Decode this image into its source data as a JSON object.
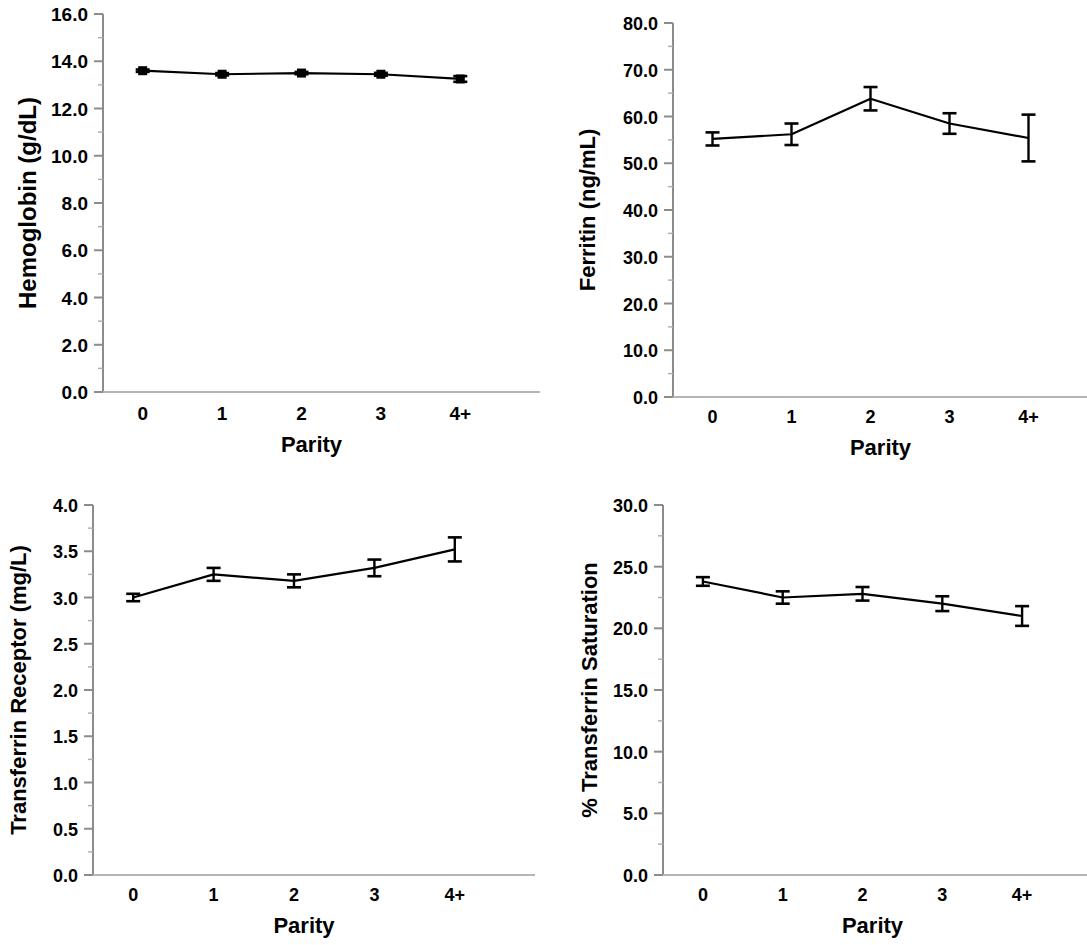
{
  "figure": {
    "panel_count": 4,
    "shared_xlabel": "Parity",
    "shared_categories": [
      "0",
      "1",
      "2",
      "3",
      "4+"
    ]
  },
  "chart_data": [
    {
      "type": "line",
      "panel": "top-left",
      "title": "",
      "xlabel": "Parity",
      "ylabel": "Hemoglobin (g/dL)",
      "categories": [
        "0",
        "1",
        "2",
        "3",
        "4+"
      ],
      "values": [
        13.6,
        13.45,
        13.5,
        13.45,
        13.25
      ],
      "errors": [
        0.05,
        0.05,
        0.05,
        0.06,
        0.12
      ],
      "ylim": [
        0.0,
        16.0
      ],
      "ytick_step": 2.0,
      "yticks": [
        "0.0",
        "2.0",
        "4.0",
        "6.0",
        "8.0",
        "10.0",
        "12.0",
        "14.0",
        "16.0"
      ],
      "marker": "square",
      "grid": false,
      "legend": "none",
      "line_color": "#000000"
    },
    {
      "type": "line",
      "panel": "top-right",
      "title": "",
      "xlabel": "Parity",
      "ylabel": "Ferritin (ng/mL)",
      "categories": [
        "0",
        "1",
        "2",
        "3",
        "4+"
      ],
      "values": [
        55.2,
        56.2,
        63.8,
        58.5,
        55.4
      ],
      "errors": [
        1.4,
        2.3,
        2.5,
        2.2,
        5.0
      ],
      "ylim": [
        0.0,
        80.0
      ],
      "ytick_step": 10.0,
      "yticks": [
        "0.0",
        "10.0",
        "20.0",
        "30.0",
        "40.0",
        "50.0",
        "60.0",
        "70.0",
        "80.0"
      ],
      "marker": "none",
      "grid": false,
      "legend": "none",
      "line_color": "#000000"
    },
    {
      "type": "line",
      "panel": "bottom-left",
      "title": "",
      "xlabel": "Parity",
      "ylabel": "Transferrin Receptor (mg/L)",
      "categories": [
        "0",
        "1",
        "2",
        "3",
        "4+"
      ],
      "values": [
        3.0,
        3.25,
        3.18,
        3.32,
        3.52
      ],
      "errors": [
        0.04,
        0.07,
        0.07,
        0.09,
        0.13
      ],
      "ylim": [
        0.0,
        4.0
      ],
      "ytick_step": 0.5,
      "yticks": [
        "0.0",
        "0.5",
        "1.0",
        "1.5",
        "2.0",
        "2.5",
        "3.0",
        "3.5",
        "4.0"
      ],
      "marker": "none",
      "grid": false,
      "legend": "none",
      "line_color": "#000000"
    },
    {
      "type": "line",
      "panel": "bottom-right",
      "title": "",
      "xlabel": "Parity",
      "ylabel": "% Transferrin Saturation",
      "categories": [
        "0",
        "1",
        "2",
        "3",
        "4+"
      ],
      "values": [
        23.8,
        22.5,
        22.8,
        22.0,
        21.0
      ],
      "errors": [
        0.35,
        0.5,
        0.55,
        0.6,
        0.8
      ],
      "ylim": [
        0.0,
        30.0
      ],
      "ytick_step": 5.0,
      "yticks": [
        "0.0",
        "5.0",
        "10.0",
        "15.0",
        "20.0",
        "25.0",
        "30.0"
      ],
      "marker": "none",
      "grid": false,
      "legend": "none",
      "line_color": "#000000"
    }
  ]
}
